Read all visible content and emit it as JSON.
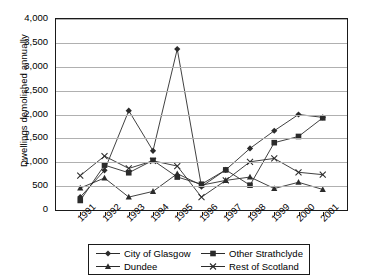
{
  "chart_data": {
    "type": "line",
    "title": "",
    "xlabel": "",
    "ylabel": "Dwellings demolished annually",
    "categories": [
      "1991",
      "1992",
      "1993",
      "1994",
      "1995",
      "1996",
      "1997",
      "1998",
      "1999",
      "2000",
      "2001"
    ],
    "ylim": [
      0,
      4000
    ],
    "ytick_labels": [
      "4,000",
      "3,500",
      "3,000",
      "2,500",
      "2,000",
      "1,500",
      "1,000",
      "500",
      "0"
    ],
    "ytick_values": [
      4000,
      3500,
      3000,
      2500,
      2000,
      1500,
      1000,
      500,
      0
    ],
    "grid": true,
    "legend_position": "bottom",
    "series": [
      {
        "name": "City of Glasgow",
        "marker": "diamond",
        "values": [
          270,
          830,
          2080,
          1240,
          3370,
          490,
          840,
          1290,
          1660,
          2000,
          1940
        ]
      },
      {
        "name": "Other Strathclyde",
        "marker": "square",
        "values": [
          200,
          940,
          780,
          1040,
          690,
          540,
          840,
          520,
          1410,
          1540,
          1930
        ]
      },
      {
        "name": "Dundee",
        "marker": "triangle",
        "values": [
          460,
          670,
          270,
          390,
          760,
          520,
          620,
          690,
          450,
          580,
          430
        ]
      },
      {
        "name": "Rest of Scotland",
        "marker": "cross",
        "values": [
          720,
          1130,
          870,
          1030,
          920,
          270,
          620,
          1010,
          1080,
          790,
          740
        ]
      }
    ]
  },
  "colors": {
    "axis": "#1a1a1a",
    "grid": "#b0b0b0",
    "series": "#2b2b2b"
  }
}
